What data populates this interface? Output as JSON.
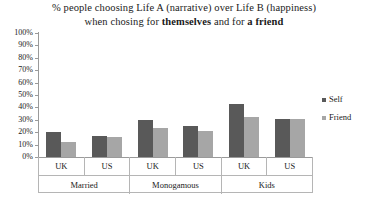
{
  "chart_data": {
    "type": "bar",
    "title": "% people choosing Life A (narrative) over Life B (happiness) when chosing for themselves and for a friend",
    "title_line1": "% people choosing Life A (narrative) over Life B (happiness)",
    "title_line2_pre": "when chosing for ",
    "title_line2_bold1": "themselves",
    "title_line2_mid": " and for ",
    "title_line2_bold2": "a friend",
    "xlabel": "",
    "ylabel": "",
    "ylim": [
      0,
      100
    ],
    "ytick_labels": [
      "100%",
      "90%",
      "80%",
      "70%",
      "60%",
      "50%",
      "40%",
      "30%",
      "20%",
      "10%",
      "0%"
    ],
    "ytick_values": [
      100,
      90,
      80,
      70,
      60,
      50,
      40,
      30,
      20,
      10,
      0
    ],
    "grid": false,
    "legend_position": "right",
    "categories": [
      "UK",
      "US",
      "UK",
      "US",
      "UK",
      "US"
    ],
    "groups": [
      {
        "label": "Married",
        "categories": [
          "UK",
          "US"
        ]
      },
      {
        "label": "Monogamous",
        "categories": [
          "UK",
          "US"
        ]
      },
      {
        "label": "Kids",
        "categories": [
          "UK",
          "US"
        ]
      }
    ],
    "series": [
      {
        "name": "Self",
        "color": "#595959",
        "values": [
          20,
          17,
          30,
          25,
          43,
          31
        ]
      },
      {
        "name": "Friend",
        "color": "#a6a6a6",
        "values": [
          12,
          16,
          23,
          21,
          32,
          31
        ]
      }
    ]
  },
  "legend": {
    "items": [
      {
        "label": "Self",
        "color": "#595959"
      },
      {
        "label": "Friend",
        "color": "#a6a6a6"
      }
    ]
  }
}
